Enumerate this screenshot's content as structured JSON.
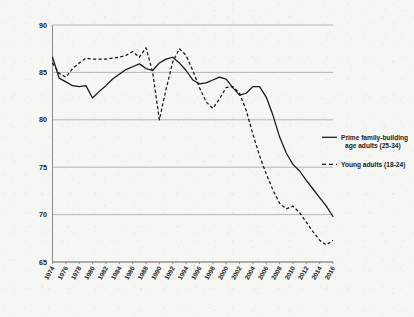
{
  "chart_data": {
    "type": "line",
    "title": "",
    "subtitle": "",
    "xlabel": "",
    "ylabel": "",
    "ylim": [
      65,
      90
    ],
    "xlim": [
      1974,
      2016
    ],
    "grid": true,
    "legend_position": "right",
    "y_ticks": [
      65,
      70,
      75,
      80,
      85,
      90
    ],
    "y_tick_labels": [
      "65",
      "70",
      "75",
      "80",
      "85",
      "90"
    ],
    "x_ticks": [
      1974,
      1976,
      1978,
      1980,
      1982,
      1984,
      1986,
      1988,
      1990,
      1992,
      1994,
      1996,
      1998,
      2000,
      2002,
      2004,
      2006,
      2008,
      2010,
      2012,
      2014,
      2016
    ],
    "x_tick_labels": [
      "1974",
      "1976",
      "1978",
      "1980",
      "1982",
      "1984",
      "1986",
      "1988",
      "1990",
      "1992",
      "1994",
      "1996",
      "1998",
      "2000",
      "2002",
      "2004",
      "2006",
      "2008",
      "2010",
      "2012",
      "2014",
      "2016"
    ],
    "x_tick_rotation": -60,
    "x": [
      1974,
      1975,
      1976,
      1977,
      1978,
      1979,
      1980,
      1981,
      1982,
      1983,
      1984,
      1985,
      1986,
      1987,
      1988,
      1989,
      1990,
      1991,
      1992,
      1993,
      1994,
      1995,
      1996,
      1997,
      1998,
      1999,
      2000,
      2001,
      2002,
      2003,
      2004,
      2005,
      2006,
      2007,
      2008,
      2009,
      2010,
      2011,
      2012,
      2013,
      2014,
      2015,
      2016
    ],
    "series": [
      {
        "name": "Prime family-building age adults (25-34)",
        "style": "solid",
        "color": "#161616",
        "values": [
          86.6,
          84.4,
          84.0,
          83.6,
          83.5,
          83.6,
          82.3,
          83.0,
          83.6,
          84.3,
          84.8,
          85.3,
          85.6,
          85.9,
          85.4,
          85.2,
          86.0,
          86.4,
          86.6,
          86.0,
          85.2,
          84.2,
          83.8,
          83.9,
          84.2,
          84.5,
          84.3,
          83.4,
          82.6,
          82.8,
          83.5,
          83.5,
          82.4,
          80.5,
          78.2,
          76.5,
          75.3,
          74.6,
          73.6,
          72.7,
          71.8,
          70.9,
          69.8
        ]
      },
      {
        "name": "Young adults (18-24)",
        "style": "dashed",
        "color": "#161616",
        "values": [
          86.0,
          84.9,
          84.5,
          85.4,
          86.0,
          86.5,
          86.4,
          86.4,
          86.4,
          86.5,
          86.6,
          86.8,
          87.2,
          86.6,
          87.6,
          85.0,
          80.0,
          83.2,
          86.1,
          87.5,
          86.8,
          85.2,
          83.4,
          81.9,
          81.2,
          82.2,
          83.4,
          83.5,
          82.8,
          81.0,
          78.5,
          76.2,
          74.3,
          72.6,
          71.2,
          70.6,
          70.9,
          70.2,
          69.2,
          68.2,
          67.3,
          66.8,
          67.3
        ]
      }
    ]
  },
  "legend": {
    "entries": [
      {
        "label_line1": "Prime family-building",
        "label_line2": "age adults (25-34)",
        "style": "solid"
      },
      {
        "label_line1": "Young adults (18-24)",
        "label_line2": "",
        "style": "dashed"
      }
    ]
  },
  "colors": {
    "background": "#f6f6f5",
    "ink": "#161616",
    "gridline": "#9a9a9a"
  }
}
